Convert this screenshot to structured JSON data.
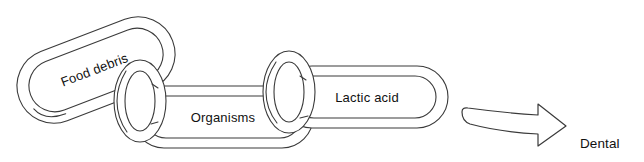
{
  "diagram": {
    "background_color": "#ffffff",
    "line_color": "#3a3a3a",
    "text_color": "#111111",
    "chain_links": [
      {
        "id": "food-debris",
        "label": "Food debris",
        "rotation_deg": -21,
        "center_x": 96,
        "center_y": 70
      },
      {
        "id": "organisms",
        "label": "Organisms",
        "rotation_deg": 0,
        "center_x": 223,
        "center_y": 118
      },
      {
        "id": "lactic-acid",
        "label": "Lactic acid",
        "rotation_deg": 0,
        "center_x": 367,
        "center_y": 98
      }
    ],
    "connector_rings": [
      {
        "id": "ring-left",
        "center_x": 140,
        "center_y": 101
      },
      {
        "id": "ring-right",
        "center_x": 289,
        "center_y": 92
      }
    ],
    "arrow": {
      "id": "outcome-arrow",
      "direction": "right",
      "style": "curved-banner-outline",
      "start_x": 461,
      "end_x": 566,
      "center_y": 124
    },
    "outcome": {
      "id": "dental-caries",
      "lines": [
        "Dental",
        "Caries"
      ],
      "text": "Dental\nCaries",
      "x": 580,
      "y": 106
    }
  }
}
